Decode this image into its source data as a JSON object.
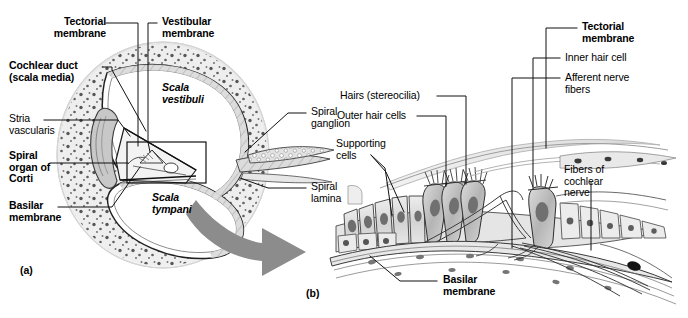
{
  "figure": {
    "type": "anatomical-diagram",
    "panels": [
      {
        "id": "a",
        "label": "(a)",
        "caption": "Cross section of the cochlear duct"
      },
      {
        "id": "b",
        "label": "(b)",
        "caption": "Magnified view of the spiral organ of Corti"
      }
    ]
  },
  "panel_a": {
    "id_label": "(a)",
    "labels": {
      "tectorial_membrane": "Tectorial\nmembrane",
      "vestibular_membrane": "Vestibular\nmembrane",
      "cochlear_duct": "Cochlear duct\n(scala media)",
      "stria_vascularis": "Stria\nvascularis",
      "spiral_organ_of_corti": "Spiral\norgan of\nCorti",
      "basilar_membrane": "Basilar\nmembrane",
      "scala_vestibuli": "Scala\nvestibuli",
      "scala_tympani": "Scala\ntympani",
      "spiral_ganglion": "Spiral\nganglion",
      "spiral_lamina": "Spiral\nlamina"
    }
  },
  "panel_b": {
    "id_label": "(b)",
    "labels": {
      "tectorial_membrane": "Tectorial\nmembrane",
      "inner_hair_cell": "Inner hair cell",
      "afferent_nerve_fibers": "Afferent nerve\nfibers",
      "hairs_stereocilia": "Hairs (stereocilia)",
      "outer_hair_cells": "Outer hair cells",
      "supporting_cells": "Supporting\ncells",
      "fibers_of_cochlear_nerve": "Fibers of\ncochlear\nnerve",
      "basilar_membrane": "Basilar\nmembrane"
    }
  },
  "colors": {
    "background": "#ffffff",
    "ink": "#000000",
    "leader_line": "#1a1a1a",
    "arrow_fill": "#8c8c8c",
    "tissue_light": "#e9e9e9",
    "tissue_mid": "#cfcfcf",
    "tissue_dark": "#9a9a9a",
    "nucleus": "#6e6e6e"
  }
}
